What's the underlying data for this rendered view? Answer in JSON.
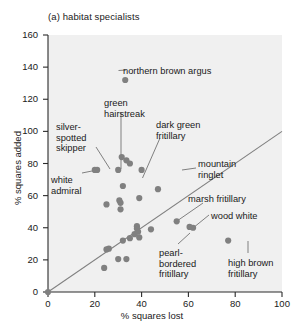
{
  "figure": {
    "title": "(a) habitat specialists",
    "background": "#f0f0f0",
    "point_color": "#808080",
    "line_color": "#808080",
    "text_color": "#1a1a1a"
  },
  "axes": {
    "x_label": "% squares lost",
    "y_label": "% squares added",
    "x_ticks": [
      "0",
      "20",
      "40",
      "60",
      "80",
      "100"
    ],
    "y_ticks": [
      "0",
      "20",
      "40",
      "60",
      "80",
      "100",
      "120",
      "140",
      "160"
    ]
  },
  "labels": {
    "northern_brown_argus": "northern brown argus",
    "green_hairstreak": "green\nhairstreak",
    "dark_green_fritillary": "dark green\nfritillary",
    "silver_spotted_skipper": "silver-\nspotted\nskipper",
    "white_admiral": "white\nadmiral",
    "mountain_ringlet": "mountain\nringlet",
    "marsh_fritillary": "marsh fritillary",
    "wood_white": "wood white",
    "pearl_bordered_fritillary": "pearl-\nbordered\nfritillary",
    "high_brown_fritillary": "high brown\nfritillary"
  },
  "chart_data": {
    "type": "scatter",
    "title": "(a) habitat specialists",
    "xlabel": "% squares lost",
    "ylabel": "% squares added",
    "xlim": [
      0,
      100
    ],
    "ylim": [
      0,
      160
    ],
    "xticks": [
      0,
      20,
      40,
      60,
      80,
      100
    ],
    "yticks": [
      0,
      20,
      40,
      60,
      80,
      100,
      120,
      140,
      160
    ],
    "grid": false,
    "legend": null,
    "reference_line": {
      "description": "1:1 line of equality",
      "x": [
        0,
        100
      ],
      "y": [
        0,
        100
      ],
      "color": "#808080"
    },
    "points": [
      {
        "x": 0,
        "y": 0,
        "name": ""
      },
      {
        "x": 33,
        "y": 132,
        "name": "northern brown argus"
      },
      {
        "x": 31.5,
        "y": 84,
        "name": "green hairstreak"
      },
      {
        "x": 35,
        "y": 80,
        "name": "dark green fritillary"
      },
      {
        "x": 20,
        "y": 76,
        "name": "silver-spotted skipper"
      },
      {
        "x": 21,
        "y": 76,
        "name": "white admiral"
      },
      {
        "x": 40,
        "y": 76,
        "name": "mountain ringlet"
      },
      {
        "x": 30,
        "y": 76,
        "name": ""
      },
      {
        "x": 33.5,
        "y": 82,
        "name": ""
      },
      {
        "x": 32,
        "y": 66,
        "name": ""
      },
      {
        "x": 47,
        "y": 64,
        "name": ""
      },
      {
        "x": 39,
        "y": 58.5,
        "name": ""
      },
      {
        "x": 30.5,
        "y": 57,
        "name": ""
      },
      {
        "x": 31,
        "y": 55.5,
        "name": ""
      },
      {
        "x": 25,
        "y": 54.5,
        "name": ""
      },
      {
        "x": 31,
        "y": 51.5,
        "name": ""
      },
      {
        "x": 55,
        "y": 44,
        "name": "marsh fritillary"
      },
      {
        "x": 60.5,
        "y": 40.5,
        "name": "pearl-bordered fritillary"
      },
      {
        "x": 62,
        "y": 40,
        "name": "wood white"
      },
      {
        "x": 77,
        "y": 32,
        "name": "high brown fritillary"
      },
      {
        "x": 38,
        "y": 41,
        "name": ""
      },
      {
        "x": 38,
        "y": 39.5,
        "name": ""
      },
      {
        "x": 44,
        "y": 39,
        "name": ""
      },
      {
        "x": 38.5,
        "y": 37.5,
        "name": ""
      },
      {
        "x": 37,
        "y": 36,
        "name": ""
      },
      {
        "x": 39,
        "y": 34,
        "name": ""
      },
      {
        "x": 35,
        "y": 33.5,
        "name": ""
      },
      {
        "x": 32,
        "y": 32,
        "name": ""
      },
      {
        "x": 26,
        "y": 27,
        "name": ""
      },
      {
        "x": 25,
        "y": 26.5,
        "name": ""
      },
      {
        "x": 30,
        "y": 20.5,
        "name": ""
      },
      {
        "x": 33.5,
        "y": 20.5,
        "name": ""
      },
      {
        "x": 24,
        "y": 15,
        "name": ""
      }
    ]
  }
}
